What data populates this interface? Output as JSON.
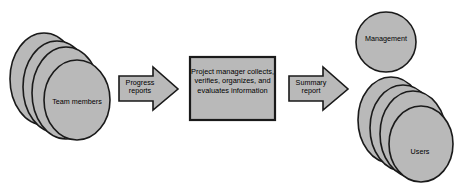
{
  "diagram": {
    "colors": {
      "shape_fill": "#b9b9b9",
      "shape_stroke": "#1a1a1a",
      "background": "#ffffff",
      "text": "#000000"
    },
    "sources": {
      "team_members": {
        "label": "Team members",
        "shape": "stacked-circles",
        "count": 4
      }
    },
    "process": {
      "box_label": "Project manager collects, verifies, organizes, and evaluates information",
      "shape": "rectangle"
    },
    "flows": [
      {
        "name": "progress-reports",
        "label": "Progress reports",
        "shape": "block-arrow-right",
        "from": "team_members",
        "to": "process"
      },
      {
        "name": "summary-report",
        "label": "Summary report",
        "shape": "block-arrow-right",
        "from": "process",
        "to": "recipients"
      }
    ],
    "recipients": {
      "management": {
        "label": "Management",
        "shape": "circle",
        "count": 1
      },
      "users": {
        "label": "Users",
        "shape": "stacked-circles",
        "count": 4
      }
    }
  }
}
